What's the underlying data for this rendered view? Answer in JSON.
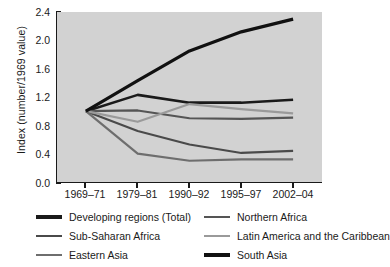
{
  "chart_data": {
    "type": "line",
    "title": "",
    "xlabel": "",
    "ylabel": "Index (number/1969 value)",
    "categories": [
      "1969–71",
      "1979–81",
      "1990–92",
      "1995–97",
      "2002–04"
    ],
    "ylim": [
      0.0,
      2.4
    ],
    "yticks": [
      "0.0",
      "0.4",
      "0.8",
      "1.2",
      "1.6",
      "2.0",
      "2.4"
    ],
    "ytick_values": [
      0.0,
      0.4,
      0.8,
      1.2,
      1.6,
      2.0,
      2.4
    ],
    "grid": false,
    "legend_position": "below-plot",
    "plot_background": "#d2d2d2",
    "series": [
      {
        "name": "Developing regions (Total)",
        "color": "#1a1a1a",
        "width": 2.6,
        "values": [
          1.0,
          1.23,
          1.12,
          1.12,
          1.16
        ]
      },
      {
        "name": "Northern Africa",
        "color": "#555555",
        "width": 2.2,
        "values": [
          1.0,
          1.01,
          0.9,
          0.89,
          0.91
        ]
      },
      {
        "name": "Sub-Saharan Africa",
        "color": "#4a4a4a",
        "width": 2.2,
        "values": [
          1.0,
          0.72,
          0.53,
          0.41,
          0.44
        ]
      },
      {
        "name": "Latin America and the Caribbean",
        "color": "#9a9a9a",
        "width": 2.2,
        "values": [
          1.0,
          0.85,
          1.1,
          1.03,
          0.97
        ]
      },
      {
        "name": "Eastern Asia",
        "color": "#6e6e6e",
        "width": 2.2,
        "values": [
          1.0,
          0.4,
          0.3,
          0.32,
          0.32
        ]
      },
      {
        "name": "South Asia",
        "color": "#111111",
        "width": 3.2,
        "values": [
          1.0,
          1.43,
          1.85,
          2.12,
          2.3
        ]
      }
    ]
  },
  "legend": {
    "entries": [
      {
        "label": "Developing regions (Total)",
        "color": "#1a1a1a",
        "width": 3.4,
        "col": 0,
        "row": 0
      },
      {
        "label": "Northern Africa",
        "color": "#555555",
        "width": 2.6,
        "col": 1,
        "row": 0
      },
      {
        "label": "Sub-Saharan Africa",
        "color": "#4a4a4a",
        "width": 2.6,
        "col": 0,
        "row": 1
      },
      {
        "label": "Latin America and the Caribbean",
        "color": "#9a9a9a",
        "width": 2.6,
        "col": 1,
        "row": 1
      },
      {
        "label": "Eastern Asia",
        "color": "#6e6e6e",
        "width": 2.6,
        "col": 0,
        "row": 2
      },
      {
        "label": "South Asia",
        "color": "#111111",
        "width": 3.4,
        "col": 1,
        "row": 2
      }
    ]
  }
}
